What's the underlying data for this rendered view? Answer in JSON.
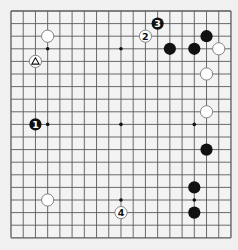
{
  "board": {
    "size": 19,
    "origin_x": 11,
    "origin_y": 11,
    "spacing_x": 12.22,
    "spacing_y": 12.6,
    "colors": {
      "background": "#f3f3f3",
      "page": "#f0f0f0",
      "line": "#5a5a5a",
      "black_stone": "#111111",
      "white_stone": "#ffffff",
      "white_stone_border": "#777777"
    },
    "star_points": [
      [
        4,
        4
      ],
      [
        10,
        4
      ],
      [
        16,
        4
      ],
      [
        4,
        10
      ],
      [
        10,
        10
      ],
      [
        16,
        10
      ],
      [
        4,
        16
      ],
      [
        10,
        16
      ],
      [
        16,
        16
      ]
    ],
    "stones": [
      {
        "color": "white",
        "col": 4,
        "row": 3,
        "label": ""
      },
      {
        "color": "white",
        "col": 3,
        "row": 5,
        "label": "",
        "marker": "triangle"
      },
      {
        "color": "black",
        "col": 3,
        "row": 10,
        "label": "1"
      },
      {
        "color": "white",
        "col": 12,
        "row": 3,
        "label": "2"
      },
      {
        "color": "black",
        "col": 13,
        "row": 2,
        "label": "3"
      },
      {
        "color": "white",
        "col": 10,
        "row": 17,
        "label": "4"
      },
      {
        "color": "black",
        "col": 14,
        "row": 4,
        "label": ""
      },
      {
        "color": "black",
        "col": 16,
        "row": 4,
        "label": ""
      },
      {
        "color": "black",
        "col": 17,
        "row": 3,
        "label": ""
      },
      {
        "color": "white",
        "col": 18,
        "row": 4,
        "label": ""
      },
      {
        "color": "white",
        "col": 17,
        "row": 6,
        "label": ""
      },
      {
        "color": "white",
        "col": 17,
        "row": 9,
        "label": ""
      },
      {
        "color": "black",
        "col": 17,
        "row": 12,
        "label": ""
      },
      {
        "color": "black",
        "col": 16,
        "row": 15,
        "label": ""
      },
      {
        "color": "black",
        "col": 16,
        "row": 17,
        "label": ""
      },
      {
        "color": "white",
        "col": 4,
        "row": 16,
        "label": ""
      }
    ]
  }
}
